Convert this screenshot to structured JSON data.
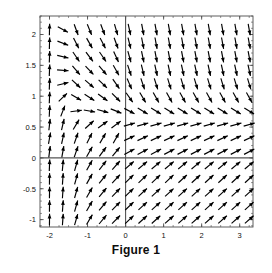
{
  "figure": {
    "caption": "Figure 1"
  },
  "chart_data": {
    "type": "scatter",
    "plot_kind": "vector-field",
    "title": "Figure 1",
    "xlabel": "",
    "ylabel": "",
    "xlim": [
      -2.25,
      3.35
    ],
    "ylim": [
      -1.12,
      2.3
    ],
    "grid": false,
    "legend": null,
    "axes": {
      "x_axis_at_y": 0,
      "y_axis_at_x": 0,
      "frame": true
    },
    "xticks": [
      -2,
      -1,
      0,
      1,
      2,
      3
    ],
    "xtick_labels": [
      "-2",
      "-1",
      "0",
      "1",
      "2",
      "3"
    ],
    "x_minor_step": 0.25,
    "yticks": [
      -1,
      -0.5,
      0,
      0.5,
      1,
      1.5,
      2
    ],
    "ytick_labels": [
      "-1",
      "-0.5",
      "0",
      "0.5",
      "1",
      "1.5",
      "2"
    ],
    "y_minor_step": 0.1,
    "field": {
      "description": "Direction field of a planar autonomous system; arrows normalized to roughly equal length. Flow points upward on the far left, downward in the upper right, up-and-right in the lower half, with a saddle-like turning region near (0.5, 0.35).",
      "x_samples": [
        -2.0,
        -1.65,
        -1.3,
        -0.95,
        -0.6,
        -0.25,
        0.1,
        0.45,
        0.8,
        1.15,
        1.5,
        1.85,
        2.2,
        2.55,
        2.9,
        3.25
      ],
      "y_samples": [
        -1.0,
        -0.78,
        -0.56,
        -0.34,
        -0.12,
        0.1,
        0.32,
        0.54,
        0.76,
        0.98,
        1.2,
        1.42,
        1.64,
        1.86,
        2.08
      ],
      "nx": 16,
      "ny": 15,
      "arrow_count": 240,
      "arrow_length_px": 11.5,
      "arrow_color": "#000000"
    },
    "colors": {
      "arrow": "#000000",
      "axis": "#555555",
      "frame": "#4d4d4d",
      "background": "#ffffff",
      "tick_text": "#111111",
      "caption": "#0d0d0d"
    }
  }
}
